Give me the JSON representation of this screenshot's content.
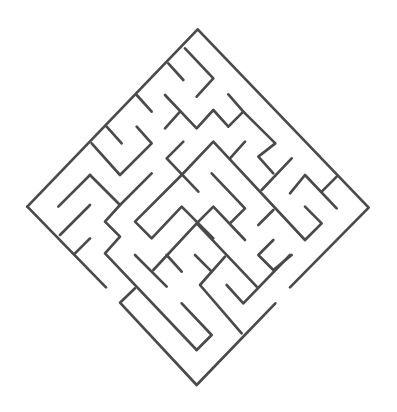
{
  "puzzle": {
    "type": "maze",
    "orientation": "diamond (rotated 45 degrees)",
    "label": "Maze puzzle",
    "wall_color": "#4a4a4a",
    "background_color": "#ffffff",
    "entrances": [
      {
        "position": "bottom-left edge gap"
      },
      {
        "position": "bottom-right edge gap"
      }
    ]
  }
}
